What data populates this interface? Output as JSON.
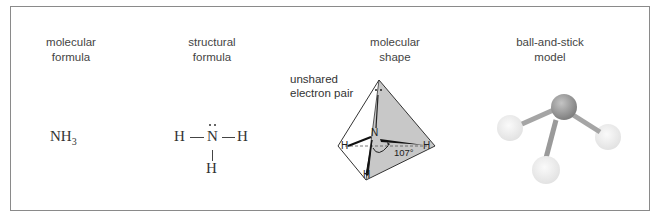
{
  "columns": [
    {
      "heading_line1": "molecular",
      "heading_line2": "formula"
    },
    {
      "heading_line1": "structural",
      "heading_line2": "formula"
    },
    {
      "heading_line1": "molecular",
      "heading_line2": "shape"
    },
    {
      "heading_line1": "ball-and-stick",
      "heading_line2": "model"
    }
  ],
  "molecular_formula": {
    "element": "NH",
    "subscript": "3"
  },
  "structural_formula": {
    "center": "N",
    "left": "H",
    "right": "H",
    "bottom": "H",
    "bond_left": "—",
    "bond_right": "—"
  },
  "molecular_shape": {
    "annotation_line1": "unshared",
    "annotation_line2": "electron pair",
    "center_atom": "N",
    "h_left": "H",
    "h_right": "H",
    "h_bottom": "H",
    "bond_angle": "107°"
  },
  "colors": {
    "frame": "#8a8a8a",
    "shade": "#c8c8c8",
    "ball_center": "#9a9a9a",
    "ball_h": "#eeeeee"
  }
}
